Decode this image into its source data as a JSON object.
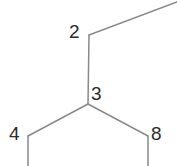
{
  "figure": {
    "type": "molecular-skeletal-structure",
    "background_color": "#ffffff",
    "bond_color": "#8a8a8a",
    "bond_width": 1.5,
    "label_color": "#2b2b2b",
    "width": 177,
    "height": 166
  },
  "atoms": [
    {
      "id": "2",
      "label": "2",
      "x": 89,
      "y": 35,
      "label_x": 69,
      "label_y": 22
    },
    {
      "id": "3",
      "label": "3",
      "x": 88,
      "y": 104,
      "label_x": 91,
      "label_y": 84
    },
    {
      "id": "4",
      "label": "4",
      "x": 28,
      "y": 136,
      "label_x": 9,
      "label_y": 124
    },
    {
      "id": "8",
      "label": "8",
      "x": 148,
      "y": 136,
      "label_x": 151,
      "label_y": 124
    }
  ],
  "bonds": [
    {
      "id": "bond-2-upright",
      "from": "2",
      "to": "offscreen-top-right",
      "x1": 89,
      "y1": 35,
      "x2": 177,
      "y2": 2,
      "order": 1
    },
    {
      "id": "bond-2-3",
      "from": "2",
      "to": "3",
      "x1": 89,
      "y1": 35,
      "x2": 88,
      "y2": 104,
      "order": 1
    },
    {
      "id": "bond-3-4",
      "from": "3",
      "to": "4",
      "x1": 88,
      "y1": 104,
      "x2": 28,
      "y2": 136,
      "order": 1
    },
    {
      "id": "bond-3-8",
      "from": "3",
      "to": "8",
      "x1": 88,
      "y1": 104,
      "x2": 148,
      "y2": 136,
      "order": 1
    },
    {
      "id": "bond-4-down",
      "from": "4",
      "to": "offscreen-bottom-left",
      "x1": 28,
      "y1": 136,
      "x2": 28,
      "y2": 166,
      "order": 1
    },
    {
      "id": "bond-8-down",
      "from": "8",
      "to": "offscreen-bottom-right",
      "x1": 148,
      "y1": 136,
      "x2": 148,
      "y2": 166,
      "order": 1
    }
  ]
}
